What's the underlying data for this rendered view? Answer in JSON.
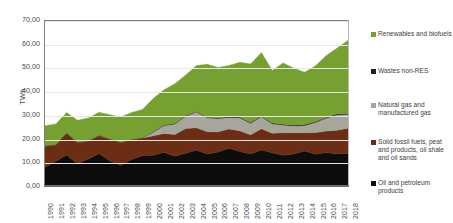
{
  "chart": {
    "type": "area",
    "ylabel": "TWh",
    "y_ticks": [
      "70,00",
      "60,00",
      "50,00",
      "40,00",
      "30,00",
      "20,00",
      "10,00",
      "0,00"
    ]
  },
  "legend": {
    "items": [
      {
        "label": "Renewables and biofuels",
        "color": "#77A033"
      },
      {
        "label": "Wastes non-RES",
        "color": "#231F20"
      },
      {
        "label": "Natural gas and manufactured gas",
        "color": "#A6A69C"
      },
      {
        "label": "Solid fossil fuels, peat and products, oil shale and oil sands",
        "color": "#6B2E14"
      },
      {
        "label": "Oil and petroleum products",
        "color": "#0D0D0D"
      }
    ]
  },
  "chart_data": {
    "type": "area",
    "stacked": true,
    "title": "",
    "subtitle": "",
    "xlabel": "",
    "ylabel": "TWh",
    "ylim": [
      0,
      70
    ],
    "ytick_values": [
      0,
      10,
      20,
      30,
      40,
      50,
      60,
      70
    ],
    "ytick_labels": [
      "0,00",
      "10,00",
      "20,00",
      "30,00",
      "40,00",
      "50,00",
      "60,00",
      "70,00"
    ],
    "grid": true,
    "legend_position": "right",
    "stack_order_bottom_to_top": [
      "Oil and petroleum products",
      "Solid fossil fuels, peat and products, oil shale and oil sands",
      "Natural gas and manufactured gas",
      "Wastes non-RES",
      "Renewables and biofuels"
    ],
    "categories": [
      "1990",
      "1991",
      "1992",
      "1993",
      "1994",
      "1995",
      "1996",
      "1997",
      "1998",
      "1999",
      "2000",
      "2001",
      "2002",
      "2003",
      "2004",
      "2005",
      "2006",
      "2007",
      "2008",
      "2009",
      "2010",
      "2011",
      "2012",
      "2013",
      "2014",
      "2015",
      "2016",
      "2017",
      "2018"
    ],
    "series": [
      {
        "name": "Oil and petroleum products",
        "color": "#0D0D0D",
        "values": [
          8.0,
          10.5,
          13.2,
          9.4,
          11.5,
          13.8,
          10.6,
          8.8,
          11.2,
          12.9,
          13.0,
          14.3,
          12.6,
          13.9,
          15.2,
          13.6,
          14.4,
          16.0,
          14.6,
          13.6,
          15.3,
          14.1,
          13.0,
          13.6,
          14.8,
          13.5,
          14.2,
          13.6,
          13.8
        ]
      },
      {
        "name": "Solid fossil fuels, peat and products, oil shale and oil sands",
        "color": "#6B2E14",
        "values": [
          9.0,
          7.0,
          9.3,
          9.1,
          7.6,
          7.6,
          9.3,
          9.7,
          8.5,
          7.5,
          8.3,
          8.0,
          9.3,
          10.5,
          9.5,
          9.4,
          8.6,
          8.2,
          8.8,
          8.1,
          9.0,
          8.3,
          9.6,
          9.0,
          7.8,
          9.2,
          9.1,
          10.1,
          10.7
        ]
      },
      {
        "name": "Natural gas and manufactured gas",
        "color": "#A6A69C",
        "values": [
          0.0,
          0.0,
          0.0,
          0.0,
          0.0,
          0.0,
          0.0,
          0.0,
          0.0,
          0.0,
          1.6,
          3.4,
          4.4,
          5.2,
          6.8,
          6.0,
          5.6,
          4.9,
          5.6,
          4.9,
          5.2,
          4.0,
          3.3,
          2.9,
          3.1,
          4.3,
          5.5,
          6.5,
          5.9
        ]
      },
      {
        "name": "Wastes non-RES",
        "color": "#231F20",
        "values": [
          0.1,
          0.1,
          0.1,
          0.1,
          0.1,
          0.1,
          0.1,
          0.1,
          0.1,
          0.1,
          0.2,
          0.2,
          0.2,
          0.2,
          0.2,
          0.2,
          0.3,
          0.3,
          0.3,
          0.3,
          0.3,
          0.3,
          0.3,
          0.3,
          0.4,
          0.4,
          0.4,
          0.4,
          0.4
        ]
      },
      {
        "name": "Renewables and biofuels",
        "color": "#77A033",
        "values": [
          8.5,
          8.7,
          8.6,
          9.3,
          9.6,
          9.8,
          10.2,
          10.7,
          11.4,
          12.0,
          14.0,
          14.9,
          16.9,
          17.3,
          19.4,
          22.4,
          21.4,
          21.7,
          23.2,
          24.9,
          26.8,
          22.3,
          26.0,
          24.2,
          22.2,
          23.6,
          26.2,
          27.9,
          31.0
        ]
      }
    ],
    "totals": [
      25.6,
      26.3,
      31.2,
      27.9,
      28.8,
      31.3,
      30.2,
      29.3,
      31.2,
      32.5,
      37.1,
      40.8,
      43.4,
      47.1,
      51.1,
      51.6,
      50.3,
      51.1,
      52.5,
      51.8,
      56.6,
      49.0,
      52.2,
      50.0,
      48.3,
      51.0,
      55.4,
      58.5,
      61.8
    ]
  }
}
